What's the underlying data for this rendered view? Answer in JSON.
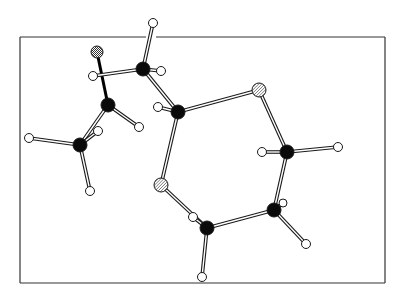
{
  "diagram": {
    "type": "ball-and-stick molecular structure",
    "frame": {
      "x1": 20,
      "y1": 37,
      "x2": 385,
      "y2": 283,
      "gap_top": [
        146,
        156
      ]
    },
    "colors": {
      "background": "#ffffff",
      "frame": "#333333",
      "carbon": "#0a0a0a",
      "hydrogen_fill": "#ffffff",
      "outline": "#1a1a1a",
      "hatch": "#555555"
    },
    "legend_atoms": {
      "carbon": "solid black sphere",
      "hydrogen": "small white sphere",
      "oxygen": "diagonally hatched sphere",
      "halogen": "stippled sphere"
    },
    "atoms": [
      {
        "id": "X1",
        "kind": "stippled",
        "x": 97,
        "y": 52,
        "r": 6
      },
      {
        "id": "C1",
        "kind": "carbon",
        "x": 143,
        "y": 69,
        "r": 7
      },
      {
        "id": "H1",
        "kind": "hydrogen",
        "x": 153,
        "y": 23,
        "r": 4.5
      },
      {
        "id": "H2",
        "kind": "hydrogen",
        "x": 161,
        "y": 71,
        "r": 4.5
      },
      {
        "id": "H3",
        "kind": "hydrogen",
        "x": 93,
        "y": 76,
        "r": 4.5
      },
      {
        "id": "C2",
        "kind": "carbon",
        "x": 108,
        "y": 105,
        "r": 7
      },
      {
        "id": "H4",
        "kind": "hydrogen",
        "x": 139,
        "y": 127,
        "r": 4.5
      },
      {
        "id": "C3",
        "kind": "carbon",
        "x": 80,
        "y": 145,
        "r": 7
      },
      {
        "id": "H5",
        "kind": "hydrogen",
        "x": 29,
        "y": 138,
        "r": 4.5
      },
      {
        "id": "H6",
        "kind": "hydrogen",
        "x": 98,
        "y": 131,
        "r": 4.5
      },
      {
        "id": "H7",
        "kind": "hydrogen",
        "x": 90,
        "y": 191,
        "r": 4.5
      },
      {
        "id": "C4",
        "kind": "carbon",
        "x": 178,
        "y": 112,
        "r": 7
      },
      {
        "id": "H8",
        "kind": "hydrogen",
        "x": 158,
        "y": 107,
        "r": 4.5
      },
      {
        "id": "O1",
        "kind": "hatched",
        "x": 259,
        "y": 90,
        "r": 7
      },
      {
        "id": "O2",
        "kind": "hatched",
        "x": 161,
        "y": 185,
        "r": 7
      },
      {
        "id": "C5",
        "kind": "carbon",
        "x": 287,
        "y": 152,
        "r": 7
      },
      {
        "id": "H9",
        "kind": "hydrogen",
        "x": 262,
        "y": 152,
        "r": 4.5
      },
      {
        "id": "H10",
        "kind": "hydrogen",
        "x": 338,
        "y": 147,
        "r": 4.5
      },
      {
        "id": "C6",
        "kind": "carbon",
        "x": 274,
        "y": 210,
        "r": 7
      },
      {
        "id": "H11",
        "kind": "hydrogen",
        "x": 283,
        "y": 203,
        "r": 4
      },
      {
        "id": "H12",
        "kind": "hydrogen",
        "x": 306,
        "y": 244,
        "r": 4.5
      },
      {
        "id": "C7",
        "kind": "carbon",
        "x": 207,
        "y": 228,
        "r": 7
      },
      {
        "id": "H13",
        "kind": "hydrogen",
        "x": 193,
        "y": 217,
        "r": 4.5
      },
      {
        "id": "H14",
        "kind": "hydrogen",
        "x": 202,
        "y": 277,
        "r": 4.5
      }
    ],
    "bonds": [
      {
        "a": "X1",
        "b": "C2",
        "style": "solid"
      },
      {
        "a": "C1",
        "b": "H1",
        "style": "open"
      },
      {
        "a": "C1",
        "b": "H2",
        "style": "open"
      },
      {
        "a": "C1",
        "b": "H3",
        "style": "open"
      },
      {
        "a": "C1",
        "b": "C4",
        "style": "open"
      },
      {
        "a": "C2",
        "b": "H4",
        "style": "open"
      },
      {
        "a": "C2",
        "b": "C3",
        "style": "open"
      },
      {
        "a": "C3",
        "b": "H5",
        "style": "open"
      },
      {
        "a": "C3",
        "b": "H6",
        "style": "open"
      },
      {
        "a": "C3",
        "b": "H7",
        "style": "open"
      },
      {
        "a": "C4",
        "b": "H8",
        "style": "open"
      },
      {
        "a": "C4",
        "b": "O1",
        "style": "open"
      },
      {
        "a": "C4",
        "b": "O2",
        "style": "open"
      },
      {
        "a": "O1",
        "b": "C5",
        "style": "open"
      },
      {
        "a": "C5",
        "b": "H9",
        "style": "open"
      },
      {
        "a": "C5",
        "b": "H10",
        "style": "open"
      },
      {
        "a": "C5",
        "b": "C6",
        "style": "open"
      },
      {
        "a": "C6",
        "b": "H11",
        "style": "open"
      },
      {
        "a": "C6",
        "b": "H12",
        "style": "open"
      },
      {
        "a": "C6",
        "b": "C7",
        "style": "open"
      },
      {
        "a": "O2",
        "b": "C7",
        "style": "open"
      },
      {
        "a": "C7",
        "b": "H13",
        "style": "open"
      },
      {
        "a": "C7",
        "b": "H14",
        "style": "open"
      }
    ]
  }
}
